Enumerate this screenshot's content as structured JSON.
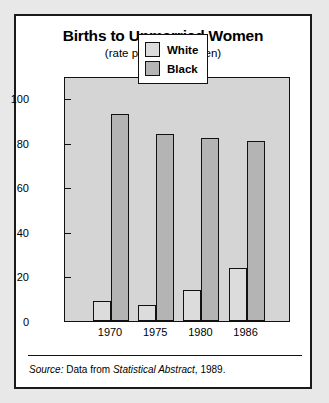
{
  "chart_data": {
    "type": "bar",
    "title": "Births to Unmarried Women",
    "subtitle": "(rate per 1000 women)",
    "xlabel": "",
    "ylabel": "",
    "ylim": [
      0,
      110
    ],
    "yticks": [
      0,
      20,
      40,
      60,
      80,
      100
    ],
    "grid": false,
    "legend_position": "top-right",
    "categories": [
      "1970",
      "1975",
      "1980",
      "1986"
    ],
    "series": [
      {
        "name": "White",
        "color": "#dcdcdc",
        "values": [
          9,
          7,
          14,
          24
        ]
      },
      {
        "name": "Black",
        "color": "#b4b4b4",
        "values": [
          93,
          84,
          82,
          81
        ]
      }
    ]
  },
  "source": {
    "prefix": "Source:",
    "middle": " Data from ",
    "work": "Statistical Abstract",
    "suffix": ", 1989."
  }
}
